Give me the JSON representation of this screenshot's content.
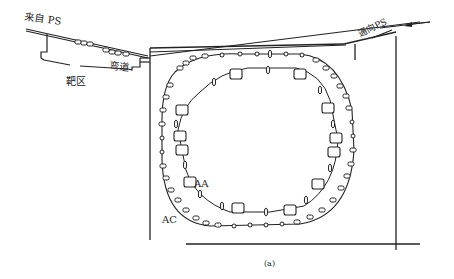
{
  "diagram": {
    "labels": {
      "from_ps": "来自 PS",
      "to_ps": "通向PS",
      "bend": "弯道",
      "target_area": "靶区",
      "aa_ring": "AA",
      "ac_ring": "AC",
      "caption": "(a)"
    },
    "colors": {
      "line": "#222222",
      "background": "#ffffff"
    },
    "elements": [
      {
        "id": "injection-line",
        "from": "来自 PS",
        "to": "弯道"
      },
      {
        "id": "extraction-line",
        "from": "AA",
        "to": "通向PS"
      },
      {
        "id": "ac-ring",
        "label": "AC",
        "shape": "outer rounded ring with magnet chain"
      },
      {
        "id": "aa-ring",
        "label": "AA",
        "shape": "inner rounded square ring with large magnets"
      },
      {
        "id": "hall-wall",
        "shape": "rectangular building outline"
      }
    ]
  }
}
